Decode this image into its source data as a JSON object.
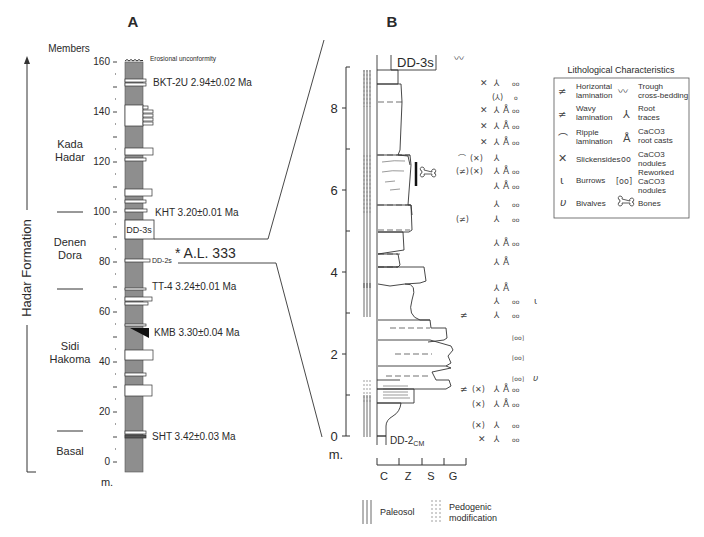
{
  "panel_a": {
    "label": "A",
    "members_header": "Members",
    "formation_label": "Hadar Formation",
    "unit": "m.",
    "top_label": "Erosional unconformity",
    "y_ticks": [
      "160",
      "140",
      "120",
      "100",
      "80",
      "60",
      "40",
      "20",
      "0"
    ],
    "members": [
      {
        "name_line1": "Kada",
        "name_line2": "Hadar"
      },
      {
        "name_line1": "Denen",
        "name_line2": "Dora"
      },
      {
        "name_line1": "Sidi",
        "name_line2": "Hakoma"
      },
      {
        "name_line1": "Basal",
        "name_line2": ""
      }
    ],
    "tephra": [
      {
        "name": "BKT-2U",
        "age": "2.94±0.02 Ma",
        "label": "BKT-2U  2.94±0.02 Ma"
      },
      {
        "name": "KHT",
        "age": "3.20±0.01 Ma",
        "label": "KHT  3.20±0.01 Ma"
      },
      {
        "name": "TT-4",
        "age": "3.24±0.01 Ma",
        "label": "TT-4  3.24±0.01 Ma"
      },
      {
        "name": "KMB",
        "age": "3.30±0.04 Ma",
        "label": "KMB 3.30±0.04 Ma"
      },
      {
        "name": "SHT",
        "age": "3.42±0.03 Ma",
        "label": "SHT  3.42±0.03 Ma"
      }
    ],
    "units": {
      "dd3s": "DD-3s",
      "dd2s": "DD-2s"
    },
    "locality": "* A.L. 333"
  },
  "panel_b": {
    "label": "B",
    "top_unit": "DD-3s",
    "bottom_unit": "DD-2",
    "bottom_unit_sub": "CM",
    "unit": "m.",
    "y_ticks": [
      "8",
      "6",
      "4",
      "2",
      "0"
    ],
    "grain_size": [
      "C",
      "Z",
      "S",
      "G"
    ],
    "key": {
      "paleosol": "Paleosol",
      "pedogenic_line1": "Pedogenic",
      "pedogenic_line2": "modification"
    }
  },
  "legend": {
    "title": "Lithological Characteristics",
    "items": [
      {
        "symbol": "horizontal-lamination",
        "line1": "Horizontal",
        "line2": "lamination"
      },
      {
        "symbol": "trough-cross-bedding",
        "line1": "Trough",
        "line2": "cross-bedding"
      },
      {
        "symbol": "wavy-lamination",
        "line1": "Wavy",
        "line2": "lamination"
      },
      {
        "symbol": "root-traces",
        "line1": "Root",
        "line2": "traces"
      },
      {
        "symbol": "ripple-lamination",
        "line1": "Ripple",
        "line2": "lamination"
      },
      {
        "symbol": "caco3-root-casts",
        "line1": "CaCO3",
        "line2": "root casts"
      },
      {
        "symbol": "slickensides",
        "line1": "Slickensides",
        "line2": ""
      },
      {
        "symbol": "caco3-nodules",
        "line1": "CaCO3",
        "line2": "nodules"
      },
      {
        "symbol": "burrows",
        "line1": "Burrows",
        "line2": ""
      },
      {
        "symbol": "reworked-caco3-nodules",
        "line1": "Reworked",
        "line2": "CaCO3",
        "line3": "nodules"
      },
      {
        "symbol": "bivalves",
        "line1": "Bivalves",
        "line2": ""
      },
      {
        "symbol": "bones",
        "line1": "Bones",
        "line2": ""
      }
    ]
  },
  "colors": {
    "column_gray": "#8e8e8e",
    "line": "#333333",
    "text": "#2a2a2a"
  }
}
